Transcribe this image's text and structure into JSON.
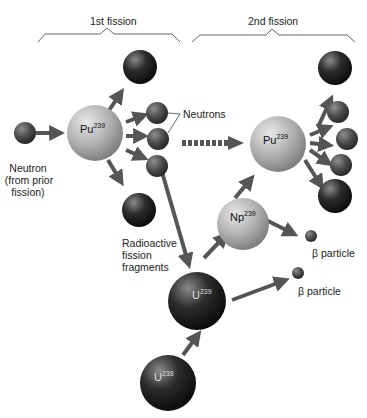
{
  "headers": {
    "first": "1st fission",
    "second": "2nd fission"
  },
  "labels": {
    "neutron_in_1": "Neutron",
    "neutron_in_2": "(from prior",
    "neutron_in_3": "fission)",
    "neutrons": "Neutrons",
    "fragments_1": "Radioactive",
    "fragments_2": "fission",
    "fragments_3": "fragments",
    "beta1": "β particle",
    "beta2": "β particle"
  },
  "nuclei": {
    "pu1": {
      "element": "Pu",
      "mass": "239"
    },
    "pu2": {
      "element": "Pu",
      "mass": "239"
    },
    "np": {
      "element": "Np",
      "mass": "239"
    },
    "u239": {
      "element": "U",
      "mass": "239"
    },
    "u238": {
      "element": "U",
      "mass": "238"
    }
  },
  "colors": {
    "arrow": "#555555",
    "light_sphere": "#b8b8b8",
    "dark_sphere": "#1e1e1e",
    "neutron": "#4a4a4a"
  }
}
